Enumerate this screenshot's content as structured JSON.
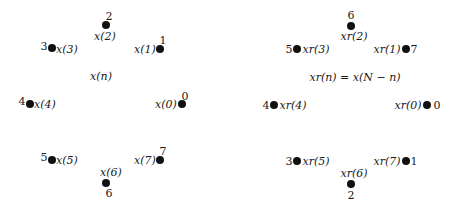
{
  "left": {
    "center_label": "x(n)",
    "points": [
      {
        "index": "0",
        "signal": "x(0)"
      },
      {
        "index": "1",
        "signal": "x(1)"
      },
      {
        "index": "2",
        "signal": "x(2)"
      },
      {
        "index": "3",
        "signal": "x(3)"
      },
      {
        "index": "4",
        "signal": "x(4)"
      },
      {
        "index": "5",
        "signal": "x(5)"
      },
      {
        "index": "6",
        "signal": "x(6)"
      },
      {
        "index": "7",
        "signal": "x(7)"
      }
    ]
  },
  "right": {
    "center_label": "xr(n) = x(N − n)",
    "points": [
      {
        "index": "0",
        "signal": "xr(0)"
      },
      {
        "index": "7",
        "signal": "xr(1)"
      },
      {
        "index": "6",
        "signal": "xr(2)"
      },
      {
        "index": "5",
        "signal": "xr(3)"
      },
      {
        "index": "4",
        "signal": "xr(4)"
      },
      {
        "index": "3",
        "signal": "xr(5)"
      },
      {
        "index": "2",
        "signal": "xr(6)"
      },
      {
        "index": "1",
        "signal": "xr(7)"
      }
    ]
  }
}
